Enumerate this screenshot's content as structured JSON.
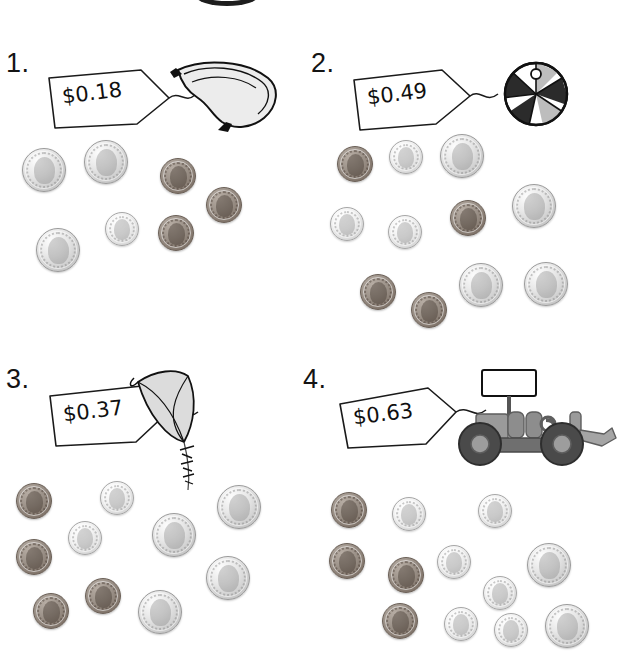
{
  "worksheet": {
    "coin_values": {
      "nickel": "5",
      "dime": "10",
      "penny": "1"
    },
    "colors": {
      "ink": "#141414",
      "nickel": "#d8d8d8",
      "dime": "#e6e6e6",
      "penny": "#8a7e74"
    }
  },
  "problems": [
    {
      "number": "1.",
      "price": "$0.18",
      "object": "banana",
      "coins": [
        {
          "type": "nickel",
          "x": 22,
          "y": 148
        },
        {
          "type": "nickel",
          "x": 84,
          "y": 140
        },
        {
          "type": "nickel",
          "x": 36,
          "y": 228
        },
        {
          "type": "dime",
          "x": 105,
          "y": 212
        },
        {
          "type": "penny",
          "x": 160,
          "y": 158
        },
        {
          "type": "penny",
          "x": 206,
          "y": 187
        },
        {
          "type": "penny",
          "x": 158,
          "y": 215
        }
      ]
    },
    {
      "number": "2.",
      "price": "$0.49",
      "object": "beach-ball",
      "coins": [
        {
          "type": "penny",
          "x": 337,
          "y": 146
        },
        {
          "type": "dime",
          "x": 389,
          "y": 140
        },
        {
          "type": "nickel",
          "x": 440,
          "y": 134
        },
        {
          "type": "nickel",
          "x": 512,
          "y": 184
        },
        {
          "type": "dime",
          "x": 330,
          "y": 207
        },
        {
          "type": "dime",
          "x": 388,
          "y": 215
        },
        {
          "type": "penny",
          "x": 450,
          "y": 200
        },
        {
          "type": "penny",
          "x": 360,
          "y": 274
        },
        {
          "type": "penny",
          "x": 411,
          "y": 292
        },
        {
          "type": "nickel",
          "x": 459,
          "y": 263
        },
        {
          "type": "nickel",
          "x": 524,
          "y": 262
        }
      ]
    },
    {
      "number": "3.",
      "price": "$0.37",
      "object": "kite",
      "coins": [
        {
          "type": "penny",
          "x": 16,
          "y": 483
        },
        {
          "type": "dime",
          "x": 100,
          "y": 481
        },
        {
          "type": "dime",
          "x": 68,
          "y": 521
        },
        {
          "type": "penny",
          "x": 16,
          "y": 539
        },
        {
          "type": "penny",
          "x": 33,
          "y": 593
        },
        {
          "type": "penny",
          "x": 85,
          "y": 578
        },
        {
          "type": "nickel",
          "x": 152,
          "y": 513
        },
        {
          "type": "nickel",
          "x": 217,
          "y": 485
        },
        {
          "type": "nickel",
          "x": 206,
          "y": 556
        },
        {
          "type": "nickel",
          "x": 138,
          "y": 590
        }
      ]
    },
    {
      "number": "4.",
      "price": "$0.63",
      "object": "tractor",
      "coins": [
        {
          "type": "penny",
          "x": 331,
          "y": 492
        },
        {
          "type": "dime",
          "x": 392,
          "y": 497
        },
        {
          "type": "dime",
          "x": 478,
          "y": 494
        },
        {
          "type": "penny",
          "x": 329,
          "y": 543
        },
        {
          "type": "dime",
          "x": 437,
          "y": 545
        },
        {
          "type": "penny",
          "x": 388,
          "y": 557
        },
        {
          "type": "dime",
          "x": 483,
          "y": 576
        },
        {
          "type": "nickel",
          "x": 527,
          "y": 543
        },
        {
          "type": "penny",
          "x": 382,
          "y": 603
        },
        {
          "type": "dime",
          "x": 444,
          "y": 607
        },
        {
          "type": "dime",
          "x": 494,
          "y": 613
        },
        {
          "type": "nickel",
          "x": 545,
          "y": 604
        }
      ]
    }
  ]
}
